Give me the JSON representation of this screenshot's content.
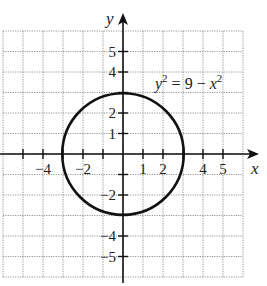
{
  "chart_data": {
    "type": "line",
    "title": "",
    "equation": "y^2 = 9 - x^2",
    "equation_parts": {
      "lhs_var": "y",
      "lhs_exp": "2",
      "middle": " = 9 − ",
      "rhs_var": "x",
      "rhs_exp": "2"
    },
    "xlabel": "x",
    "ylabel": "y",
    "xlim": [
      -6,
      6
    ],
    "ylim": [
      -6,
      6
    ],
    "grid": true,
    "x_ticks": [
      -5,
      -4,
      -3,
      -2,
      -1,
      1,
      2,
      3,
      4,
      5
    ],
    "x_tick_labels": [
      {
        "value": -4,
        "label": "−4"
      },
      {
        "value": -2,
        "label": "−2"
      },
      {
        "value": 1,
        "label": "1"
      },
      {
        "value": 2,
        "label": "2"
      },
      {
        "value": 4,
        "label": "4"
      },
      {
        "value": 5,
        "label": "5"
      }
    ],
    "y_ticks": [
      -5,
      -4,
      -3,
      -2,
      -1,
      1,
      2,
      3,
      4,
      5
    ],
    "y_tick_labels": [
      {
        "value": 5,
        "label": "5"
      },
      {
        "value": 4,
        "label": "4"
      },
      {
        "value": 2,
        "label": "2"
      },
      {
        "value": 1,
        "label": "1"
      },
      {
        "value": -2,
        "label": "−2"
      },
      {
        "value": -4,
        "label": "−4"
      },
      {
        "value": -5,
        "label": "−5"
      }
    ],
    "series": [
      {
        "name": "y^2 = 9 - x^2",
        "shape": "circle",
        "center": [
          0,
          0
        ],
        "radius": 3
      }
    ]
  }
}
